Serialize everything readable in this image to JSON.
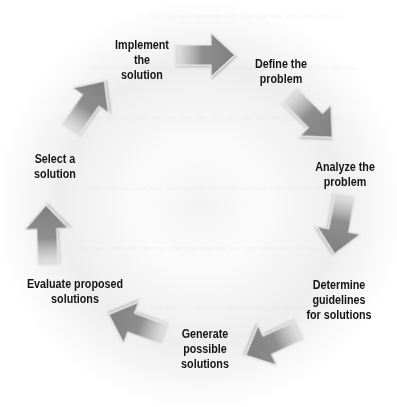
{
  "diagram": {
    "type": "cycle",
    "arrow_color": "#8c8c8c",
    "steps": [
      {
        "line1": "Define the",
        "line2": "problem",
        "line3": ""
      },
      {
        "line1": "Analyze the",
        "line2": "problem",
        "line3": ""
      },
      {
        "line1": "Determine",
        "line2": "guidelines",
        "line3": "for solutions"
      },
      {
        "line1": "Generate",
        "line2": "possible",
        "line3": "solutions"
      },
      {
        "line1": "Evaluate proposed",
        "line2": "solutions",
        "line3": ""
      },
      {
        "line1": "Select a",
        "line2": "solution",
        "line3": ""
      },
      {
        "line1": "Implement",
        "line2": "the",
        "line3": "solution"
      }
    ]
  }
}
